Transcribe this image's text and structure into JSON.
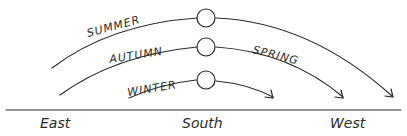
{
  "diagram": {
    "title": "",
    "paths": [
      {
        "season": "Summer",
        "label": "SUMMER"
      },
      {
        "season": "Autumn",
        "label": "AUTUMN"
      },
      {
        "season": "Spring",
        "label": "SPRING"
      },
      {
        "season": "Winter",
        "label": "WINTER"
      }
    ],
    "directions": {
      "east": "East",
      "south": "South",
      "west": "West"
    },
    "colors": {
      "ink": "#2a2a2a",
      "background": "#ffffff"
    }
  }
}
